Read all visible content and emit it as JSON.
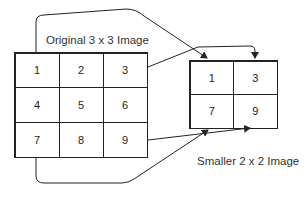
{
  "diagram": {
    "original": {
      "title": "Original 3 x 3 Image",
      "rows": 3,
      "cols": 3,
      "cells": [
        "1",
        "2",
        "3",
        "4",
        "5",
        "6",
        "7",
        "8",
        "9"
      ]
    },
    "smaller": {
      "title": "Smaller 2 x 2 Image",
      "rows": 2,
      "cols": 2,
      "cells": [
        "1",
        "3",
        "7",
        "9"
      ]
    },
    "mappings": [
      {
        "from": "1",
        "to": "1"
      },
      {
        "from": "3",
        "to": "3"
      },
      {
        "from": "7",
        "to": "7"
      },
      {
        "from": "9",
        "to": "9"
      }
    ],
    "colors": {
      "stroke": "#222222",
      "background": "#ffffff"
    }
  }
}
